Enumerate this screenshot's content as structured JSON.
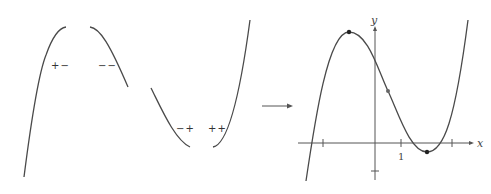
{
  "left_panel": {
    "description": "Curve segments with sign patterns of f' and f''",
    "sign_labels": [
      {
        "text": "+−",
        "x": 52,
        "y": 69
      },
      {
        "text": "−−",
        "x": 99,
        "y": 69
      },
      {
        "text": "−+",
        "x": 176,
        "y": 132
      },
      {
        "text": "++",
        "x": 208,
        "y": 132
      }
    ]
  },
  "arrow": {
    "from_x": 262,
    "to_x": 293,
    "y": 106
  },
  "right_panel": {
    "axis_labels": {
      "x": "x",
      "y": "y"
    },
    "tick_labels": {
      "x_one": "1"
    },
    "points": {
      "local_max": {
        "x": 349,
        "y": 32
      },
      "inflection": {
        "x": 388,
        "y": 91
      },
      "local_min": {
        "x": 427,
        "y": 152
      }
    }
  },
  "colors": {
    "curve": "#4a4a4a",
    "axis": "#555555",
    "background": "#ffffff"
  }
}
